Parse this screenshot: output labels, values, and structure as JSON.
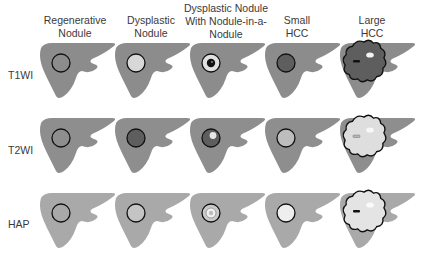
{
  "figure": {
    "columns": [
      {
        "key": "regenerative",
        "label_lines": [
          "Regenerative",
          "Nodule"
        ]
      },
      {
        "key": "dysplastic",
        "label_lines": [
          "Dysplastic",
          "Nodule"
        ]
      },
      {
        "key": "nodule_in_nodule",
        "label_lines": [
          "Dysplastic Nodule",
          "With Nodule-in-a-",
          "Nodule"
        ]
      },
      {
        "key": "small_hcc",
        "label_lines": [
          "Small",
          "HCC"
        ]
      },
      {
        "key": "large_hcc",
        "label_lines": [
          "Large",
          "HCC"
        ]
      }
    ],
    "rows": [
      {
        "label": "T1WI"
      },
      {
        "label": "T2WI"
      },
      {
        "label": "HAP"
      }
    ],
    "colors": {
      "liver_t1": "#8c8c8c",
      "liver_t2": "#8e8e8e",
      "liver_hap": "#a9a9a9",
      "outline": "#111111",
      "iso": "#8c8c8c",
      "hyper_light": "#d8d8d8",
      "hypo_dark": "#5e5e5e",
      "white": "#f4f4f4",
      "black": "#111111"
    },
    "cells": {
      "T1WI": [
        "iso",
        "hyperintense",
        "hyperintense with dark inner nodule",
        "hypointense",
        "hypointense lobulated with bright focus"
      ],
      "T2WI": [
        "iso",
        "hypointense",
        "hypointense with bright inner nodule",
        "mildly hyperintense",
        "hyperintense lobulated"
      ],
      "HAP": [
        "iso",
        "iso/slightly enhanced",
        "enhancing inner nodule",
        "arterial enhancement",
        "heterogeneous enhancement"
      ]
    }
  }
}
